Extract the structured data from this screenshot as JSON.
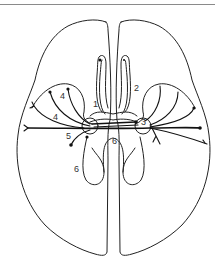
{
  "figure": {
    "labels": [
      {
        "id": "label-1",
        "text": "1",
        "x": 93,
        "y": 107
      },
      {
        "id": "label-2",
        "text": "2",
        "x": 134,
        "y": 91
      },
      {
        "id": "label-3",
        "text": "3",
        "x": 141,
        "y": 125
      },
      {
        "id": "label-4a",
        "text": "4",
        "x": 60,
        "y": 99
      },
      {
        "id": "label-4b",
        "text": "4",
        "x": 53,
        "y": 120
      },
      {
        "id": "label-5",
        "text": "5",
        "x": 66,
        "y": 139
      },
      {
        "id": "label-6a",
        "text": "6",
        "x": 112,
        "y": 144
      },
      {
        "id": "label-6b",
        "text": "6",
        "x": 74,
        "y": 172
      }
    ]
  }
}
